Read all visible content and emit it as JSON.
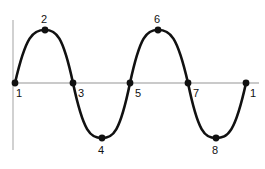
{
  "diagram": {
    "type": "sine-wave-phase-diagram",
    "colors": {
      "wave": "#111111",
      "axis": "#b8b8b8",
      "background": "#ffffff"
    },
    "points": [
      {
        "label": "1",
        "role": "zero-crossing-start",
        "x": 15,
        "y": 83,
        "label_x": 16,
        "label_y": 88
      },
      {
        "label": "2",
        "role": "peak",
        "x": 45,
        "y": 30,
        "label_x": 41,
        "label_y": 14
      },
      {
        "label": "3",
        "role": "zero-crossing",
        "x": 73,
        "y": 83,
        "label_x": 78,
        "label_y": 88
      },
      {
        "label": "4",
        "role": "trough",
        "x": 102,
        "y": 138,
        "label_x": 98,
        "label_y": 145
      },
      {
        "label": "5",
        "role": "zero-crossing",
        "x": 130,
        "y": 83,
        "label_x": 135,
        "label_y": 88
      },
      {
        "label": "6",
        "role": "peak",
        "x": 158,
        "y": 30,
        "label_x": 154,
        "label_y": 14
      },
      {
        "label": "7",
        "role": "zero-crossing",
        "x": 188,
        "y": 83,
        "label_x": 193,
        "label_y": 88
      },
      {
        "label": "8",
        "role": "trough",
        "x": 216,
        "y": 138,
        "label_x": 212,
        "label_y": 145
      },
      {
        "label": "1",
        "role": "zero-crossing-end",
        "x": 246,
        "y": 83,
        "label_x": 250,
        "label_y": 88
      }
    ],
    "axes": {
      "vertical": {
        "x": 13,
        "y1": 20,
        "y2": 150
      },
      "horizontal": {
        "y": 83,
        "x1": 13,
        "x2": 259
      }
    }
  }
}
